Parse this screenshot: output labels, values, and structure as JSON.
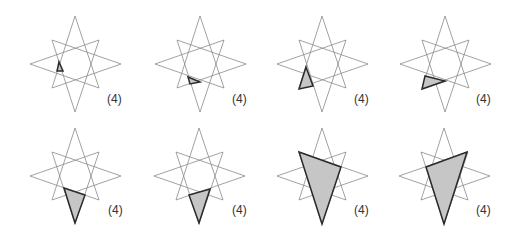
{
  "figure": {
    "star": {
      "vertex_offsets": [
        [
          0,
          -48
        ],
        [
          24,
          -24
        ],
        [
          46,
          0
        ],
        [
          24,
          24
        ],
        [
          0,
          48
        ],
        [
          -23,
          24
        ],
        [
          -45,
          0
        ],
        [
          -23,
          -24
        ]
      ],
      "step": 3
    },
    "colors": {
      "star_line": "#8a8a8a",
      "triangle_fill": "#c6c6c6",
      "triangle_stroke": "#2a2a2a",
      "label": "#333333"
    },
    "panels": [
      {
        "id": 1,
        "center": [
          75,
          64
        ],
        "label": "(4)",
        "label_pos": [
          107,
          103
        ],
        "triangle": [
          [
            59,
            62
          ],
          [
            57,
            71
          ],
          [
            63,
            71
          ]
        ]
      },
      {
        "id": 2,
        "center": [
          200,
          64
        ],
        "label": "(4)",
        "label_pos": [
          232,
          103
        ],
        "triangle": [
          [
            188,
            77
          ],
          [
            200,
            82
          ],
          [
            190,
            84
          ]
        ]
      },
      {
        "id": 3,
        "center": [
          322,
          64
        ],
        "label": "(4)",
        "label_pos": [
          354,
          103
        ],
        "triangle": [
          [
            306,
            67
          ],
          [
            299,
            89
          ],
          [
            313,
            86
          ]
        ]
      },
      {
        "id": 4,
        "center": [
          445,
          64
        ],
        "label": "(4)",
        "label_pos": [
          476,
          103
        ],
        "triangle": [
          [
            425,
            76
          ],
          [
            422,
            89
          ],
          [
            445,
            81
          ]
        ]
      },
      {
        "id": 5,
        "center": [
          75,
          176
        ],
        "label": "(4)",
        "label_pos": [
          108,
          214
        ],
        "triangle": [
          [
            64,
            188
          ],
          [
            85,
            195
          ],
          [
            75,
            223
          ]
        ]
      },
      {
        "id": 6,
        "center": [
          199,
          176
        ],
        "label": "(4)",
        "label_pos": [
          232,
          214
        ],
        "triangle": [
          [
            189,
            195
          ],
          [
            210,
            189
          ],
          [
            199,
            223
          ]
        ]
      },
      {
        "id": 7,
        "center": [
          322,
          176
        ],
        "label": "(4)",
        "label_pos": [
          354,
          214
        ],
        "triangle": [
          [
            299,
            152
          ],
          [
            341,
            167
          ],
          [
            322,
            224
          ]
        ]
      },
      {
        "id": 8,
        "center": [
          444,
          176
        ],
        "label": "(4)",
        "label_pos": [
          476,
          214
        ],
        "triangle": [
          [
            426,
            167
          ],
          [
            467,
            152
          ],
          [
            444,
            224
          ]
        ]
      }
    ]
  }
}
